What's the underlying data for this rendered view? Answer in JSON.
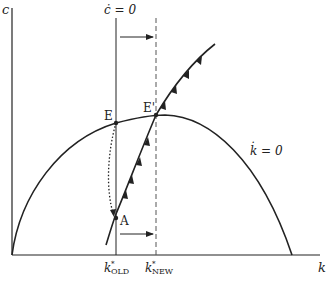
{
  "diagram": {
    "type": "phase-diagram",
    "axes": {
      "y_label": "c",
      "x_label": "k"
    },
    "curves": {
      "c_dot_zero_label": "ċ = 0",
      "k_dot_zero_label": "k̇ = 0",
      "saddle_path": "stable saddle path through A and E'"
    },
    "points": {
      "E": "E",
      "E_prime": "E'",
      "A": "A"
    },
    "ticks": {
      "k_old": {
        "base": "k",
        "sup": "*",
        "sub": "OLD"
      },
      "k_new": {
        "base": "k",
        "sup": "*",
        "sub": "NEW"
      }
    },
    "colors": {
      "ink": "#222222",
      "background": "#ffffff"
    }
  }
}
